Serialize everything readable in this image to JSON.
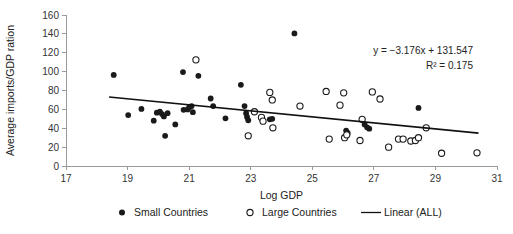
{
  "chart_data": {
    "type": "scatter",
    "title": "",
    "xlabel": "Log GDP",
    "ylabel": "Average imports/GDP ration",
    "xlim": [
      17,
      31
    ],
    "ylim": [
      0,
      160
    ],
    "xticks": [
      17,
      19,
      21,
      23,
      25,
      27,
      29,
      31
    ],
    "yticks": [
      0,
      20,
      40,
      60,
      80,
      100,
      120,
      140,
      160
    ],
    "grid": false,
    "legend_position": "bottom",
    "annotations": [
      "y = −3.176x + 131.547",
      "R² = 0.175"
    ],
    "equation": {
      "slope": -3.176,
      "intercept": 131.547,
      "r_squared": 0.175,
      "line_text": "y = −3.176x + 131.547",
      "r2_text": "R² = 0.175"
    },
    "trendline": {
      "name": "Linear (ALL)",
      "x_start": 18.4,
      "y_start": 73.1,
      "x_end": 30.4,
      "y_end": 34.9,
      "color": "#111111"
    },
    "series": [
      {
        "name": "Small Countries",
        "marker": "filled-circle",
        "color": "#1a1a1a",
        "points": [
          [
            18.55,
            96.5
          ],
          [
            19.02,
            54.0
          ],
          [
            19.45,
            60.5
          ],
          [
            19.85,
            48.0
          ],
          [
            19.95,
            56.5
          ],
          [
            20.05,
            57.5
          ],
          [
            20.12,
            55.0
          ],
          [
            20.18,
            52.5
          ],
          [
            20.3,
            56.0
          ],
          [
            20.22,
            32.0
          ],
          [
            20.55,
            44.0
          ],
          [
            20.8,
            99.5
          ],
          [
            20.82,
            59.5
          ],
          [
            20.95,
            60.0
          ],
          [
            21.0,
            62.0
          ],
          [
            21.08,
            63.5
          ],
          [
            21.12,
            57.0
          ],
          [
            21.3,
            95.5
          ],
          [
            21.7,
            71.5
          ],
          [
            21.78,
            63.5
          ],
          [
            22.18,
            50.5
          ],
          [
            22.68,
            86.0
          ],
          [
            22.8,
            63.5
          ],
          [
            22.85,
            56.0
          ],
          [
            22.88,
            52.0
          ],
          [
            22.92,
            48.5
          ],
          [
            23.62,
            49.5
          ],
          [
            23.7,
            50.0
          ],
          [
            24.42,
            140.5
          ],
          [
            26.1,
            37.5
          ],
          [
            26.15,
            35.0
          ],
          [
            26.7,
            44.0
          ],
          [
            26.78,
            41.0
          ],
          [
            26.85,
            39.5
          ],
          [
            28.45,
            61.5
          ]
        ]
      },
      {
        "name": "Large Countries",
        "marker": "open-circle",
        "color": "#1a1a1a",
        "points": [
          [
            21.22,
            112.5
          ],
          [
            22.92,
            32.0
          ],
          [
            23.12,
            57.5
          ],
          [
            23.35,
            51.5
          ],
          [
            23.4,
            47.5
          ],
          [
            23.62,
            78.0
          ],
          [
            23.7,
            70.0
          ],
          [
            23.72,
            40.5
          ],
          [
            24.6,
            63.5
          ],
          [
            25.45,
            79.0
          ],
          [
            25.55,
            28.5
          ],
          [
            25.9,
            64.5
          ],
          [
            26.02,
            77.5
          ],
          [
            26.05,
            30.0
          ],
          [
            26.12,
            33.0
          ],
          [
            26.55,
            27.0
          ],
          [
            26.62,
            49.5
          ],
          [
            26.95,
            78.5
          ],
          [
            27.2,
            71.0
          ],
          [
            27.48,
            20.0
          ],
          [
            27.8,
            28.5
          ],
          [
            27.95,
            28.5
          ],
          [
            28.2,
            26.5
          ],
          [
            28.35,
            27.0
          ],
          [
            28.45,
            30.0
          ],
          [
            28.7,
            40.5
          ],
          [
            29.2,
            13.5
          ],
          [
            30.35,
            14.0
          ]
        ]
      }
    ],
    "legend": [
      {
        "label": "Small Countries",
        "marker": "filled-circle"
      },
      {
        "label": "Large Countries",
        "marker": "open-circle"
      },
      {
        "label": "Linear (ALL)",
        "marker": "line"
      }
    ]
  }
}
